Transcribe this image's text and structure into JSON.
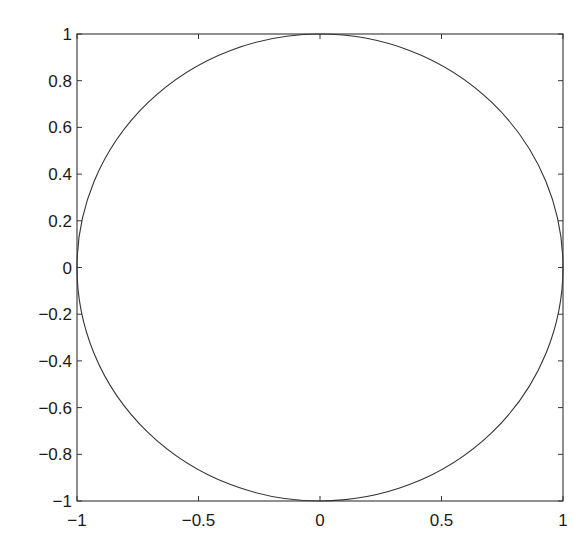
{
  "chart_data": {
    "type": "line",
    "title": "",
    "xlabel": "",
    "ylabel": "",
    "xlim": [
      -1,
      1
    ],
    "ylim": [
      -1,
      1
    ],
    "grid": false,
    "legend": null,
    "x_ticks": [
      -1,
      -0.5,
      0,
      0.5,
      1
    ],
    "x_tick_labels": [
      "−1",
      "−0.5",
      "0",
      "0.5",
      "1"
    ],
    "y_ticks": [
      1,
      0.8,
      0.6,
      0.4,
      0.2,
      0,
      -0.2,
      -0.4,
      -0.6,
      -0.8,
      -1
    ],
    "y_tick_labels": [
      "1",
      "0.8",
      "0.6",
      "0.4",
      "0.2",
      "0",
      "−0.2",
      "−0.4",
      "−0.6",
      "−0.8",
      "−1"
    ],
    "series": [
      {
        "name": "unit circle",
        "description": "x = cos(t), y = sin(t), t in [0, 2π]",
        "center": [
          0,
          0
        ],
        "radius": 1,
        "color": "#333333"
      }
    ]
  },
  "style": {
    "axis_color": "#333333",
    "line_color": "#333333",
    "background": "#ffffff"
  }
}
